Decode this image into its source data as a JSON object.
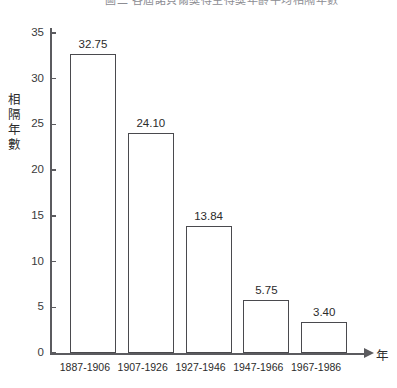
{
  "figure": {
    "clipped_title": "圖二  各屆諾貝爾獎得主得獎年齡平均相隔年數",
    "background_color": "#ffffff",
    "axis_color": "#5b5b5f",
    "bar_outline_color": "#4a4a4e",
    "bar_fill_color": "#ffffff"
  },
  "chart_data": {
    "type": "bar",
    "title": "",
    "categories": [
      "1887-1906",
      "1907-1926",
      "1927-1946",
      "1947-1966",
      "1967-1986"
    ],
    "values": [
      32.75,
      24.1,
      13.84,
      5.75,
      3.4
    ],
    "value_labels": [
      "32.75",
      "24.10",
      "13.84",
      "5.75",
      "3.40"
    ],
    "xlabel": "年",
    "ylabel": "相隔年數",
    "ylabel_chars": [
      "相",
      "隔",
      "年",
      "數"
    ],
    "ylim": [
      0,
      35
    ],
    "ytick_values": [
      0,
      5,
      10,
      15,
      20,
      25,
      30,
      35
    ],
    "ytick_labels": [
      "0",
      "5",
      "10",
      "15",
      "20",
      "25",
      "30",
      "35"
    ],
    "grid": false,
    "legend": false,
    "x_axis_arrow": true
  }
}
